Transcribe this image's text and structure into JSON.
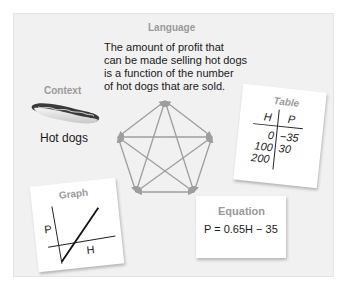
{
  "language": {
    "heading": "Language",
    "lines": [
      "The amount of profit that",
      "can be made selling hot dogs",
      "is a function of the number",
      "of hot dogs that are sold."
    ]
  },
  "context": {
    "heading": "Context",
    "icon": "hot-dog-icon",
    "label": "Hot dogs"
  },
  "table": {
    "heading": "Table",
    "columns": [
      "H",
      "P"
    ],
    "rows": [
      {
        "H": "0",
        "P": "−35"
      },
      {
        "H": "100",
        "P": "30"
      },
      {
        "H": "200",
        "P": ""
      }
    ]
  },
  "graph": {
    "heading": "Graph",
    "y_label": "P",
    "x_label": "H"
  },
  "equation": {
    "heading": "Equation",
    "formula": "P = 0.65H − 35"
  },
  "connector": {
    "shape": "pentagram-with-pentagon",
    "arrow_color": "#9e9e9e",
    "style": "double-headed-arrows"
  },
  "colors": {
    "panel_bg": "#f1f1f1",
    "heading": "#9a9a9a",
    "text": "#1a1a1a",
    "card_bg": "#ffffff"
  }
}
